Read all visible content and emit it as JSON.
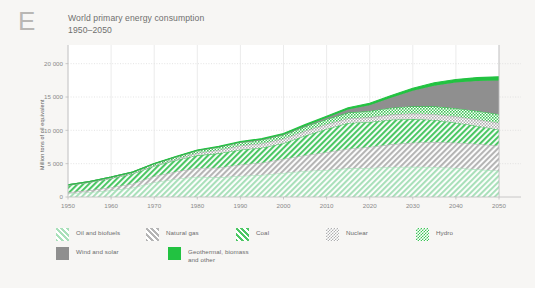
{
  "panel": {
    "letter": "E"
  },
  "header": {
    "title": "World primary energy consumption",
    "subtitle": "1950–2050"
  },
  "axes": {
    "ylabel": "Million tons of oil equivalent",
    "yticks": [
      "0",
      "5 000",
      "10 000",
      "15 000",
      "20 000"
    ],
    "xticks": [
      "1950",
      "1960",
      "1970",
      "1980",
      "1990",
      "2000",
      "2010",
      "2020",
      "2030",
      "2040",
      "2050"
    ]
  },
  "legend": {
    "row1": [
      {
        "label": "Oil and biofuels",
        "key": "oil",
        "swatch": "hatch-light-green"
      },
      {
        "label": "Natural gas",
        "key": "gas",
        "swatch": "hatch-gray"
      },
      {
        "label": "Coal",
        "key": "coal",
        "swatch": "hatch-green"
      },
      {
        "label": "Nuclear",
        "key": "nuclear",
        "swatch": "check-gray"
      },
      {
        "label": "Hydro",
        "key": "hydro",
        "swatch": "check-green"
      }
    ],
    "row2": [
      {
        "label": "Wind and solar",
        "key": "wind_solar",
        "swatch": "solid-gray"
      },
      {
        "label": "Geothermal, biomass\nand other",
        "key": "geothermal",
        "swatch": "solid-green"
      }
    ]
  },
  "colors": {
    "background": "#f7f6f4",
    "plot_background": "#ffffff",
    "axis": "#bdbdbd",
    "gridline": "#d8d8d8",
    "oil": "#a9e0ba",
    "gas": "#b5b5b5",
    "coal": "#4cc764",
    "nuclear": "#b0b0b0",
    "hydro": "#3fc457",
    "wind_solar": "#8f8f8f",
    "geothermal": "#22c241",
    "text": "#6f6f6f",
    "tick_text": "#8a8a8a",
    "panel_letter": "#b9b7b4"
  },
  "chart_data": {
    "type": "area",
    "title": "World primary energy consumption",
    "subtitle": "1950–2050",
    "xlabel": "",
    "ylabel": "Million tons of oil equivalent",
    "stacked": true,
    "grid": true,
    "legend_position": "bottom",
    "xlim": [
      1950,
      2050
    ],
    "ylim": [
      0,
      21000
    ],
    "x": [
      1950,
      1955,
      1960,
      1965,
      1970,
      1975,
      1980,
      1985,
      1990,
      1995,
      2000,
      2005,
      2010,
      2015,
      2020,
      2025,
      2030,
      2035,
      2040,
      2045,
      2050
    ],
    "series": [
      {
        "name": "Oil and biofuels",
        "key": "oil",
        "color": "#a9e0ba",
        "pattern": "hatch",
        "values": [
          520,
          720,
          1000,
          1400,
          2200,
          2700,
          3050,
          2950,
          3150,
          3300,
          3600,
          3900,
          4050,
          4300,
          4350,
          4500,
          4550,
          4500,
          4350,
          4150,
          3950
        ]
      },
      {
        "name": "Natural gas",
        "key": "gas",
        "color": "#b5b5b5",
        "pattern": "hatch",
        "values": [
          180,
          280,
          420,
          600,
          900,
          1100,
          1300,
          1450,
          1700,
          1850,
          2100,
          2350,
          2650,
          2950,
          3150,
          3400,
          3600,
          3750,
          3800,
          3800,
          3750
        ]
      },
      {
        "name": "Coal",
        "key": "coal",
        "color": "#4cc764",
        "pattern": "hatch",
        "values": [
          1050,
          1200,
          1400,
          1500,
          1550,
          1700,
          1900,
          2150,
          2250,
          2250,
          2350,
          2950,
          3500,
          3850,
          3750,
          3700,
          3550,
          3300,
          3000,
          2700,
          2400
        ]
      },
      {
        "name": "Nuclear",
        "key": "nuclear",
        "color": "#b0b0b0",
        "pattern": "check",
        "values": [
          0,
          0,
          10,
          30,
          80,
          180,
          350,
          500,
          600,
          640,
          680,
          700,
          700,
          680,
          700,
          760,
          820,
          880,
          930,
          970,
          1000
        ]
      },
      {
        "name": "Hydro",
        "key": "hydro",
        "color": "#3fc457",
        "pattern": "check",
        "values": [
          80,
          110,
          150,
          200,
          260,
          320,
          380,
          440,
          500,
          560,
          600,
          670,
          780,
          880,
          950,
          1030,
          1100,
          1170,
          1230,
          1280,
          1330
        ]
      },
      {
        "name": "Wind and solar",
        "key": "wind_solar",
        "color": "#8f8f8f",
        "pattern": "solid",
        "values": [
          0,
          0,
          0,
          0,
          0,
          0,
          0,
          0,
          5,
          15,
          40,
          90,
          200,
          450,
          850,
          1500,
          2300,
          3100,
          3850,
          4500,
          5050
        ]
      },
      {
        "name": "Geothermal, biomass and other",
        "key": "geothermal",
        "color": "#22c241",
        "pattern": "solid",
        "values": [
          10,
          15,
          20,
          30,
          45,
          60,
          80,
          100,
          120,
          140,
          165,
          195,
          230,
          270,
          310,
          350,
          390,
          430,
          470,
          510,
          545
        ]
      }
    ]
  }
}
